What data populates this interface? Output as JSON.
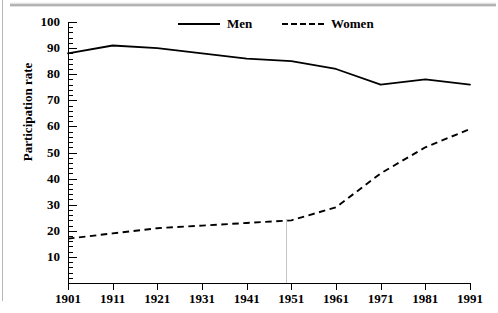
{
  "chart_data": {
    "type": "line",
    "title": "",
    "xlabel": "",
    "ylabel": "Participation rate",
    "x": [
      1901,
      1911,
      1921,
      1931,
      1941,
      1951,
      1961,
      1971,
      1981,
      1991
    ],
    "categories": [
      "1901",
      "1911",
      "1921",
      "1931",
      "1941",
      "1951",
      "1961",
      "1971",
      "1981",
      "1991"
    ],
    "xlim": [
      1901,
      1991
    ],
    "ylim": [
      0,
      100
    ],
    "yticks": [
      10,
      20,
      30,
      40,
      50,
      60,
      70,
      80,
      90,
      100
    ],
    "ytick_labels": [
      "10",
      "20",
      "30",
      "40",
      "50",
      "60",
      "70",
      "80",
      "90",
      "100"
    ],
    "minor_ticks": true,
    "grid": false,
    "legend_position": "top-center",
    "series": [
      {
        "name": "Men",
        "style": "solid",
        "color": "#000000",
        "values": [
          88,
          91,
          90,
          88,
          86,
          85,
          82,
          76,
          78,
          76
        ]
      },
      {
        "name": "Women",
        "style": "dashed",
        "color": "#000000",
        "values": [
          17,
          19,
          21,
          22,
          23,
          24,
          29,
          42,
          52,
          59
        ]
      }
    ]
  },
  "legend": {
    "men_label": "Men",
    "women_label": "Women"
  },
  "axes": {
    "y_title": "Participation rate"
  }
}
